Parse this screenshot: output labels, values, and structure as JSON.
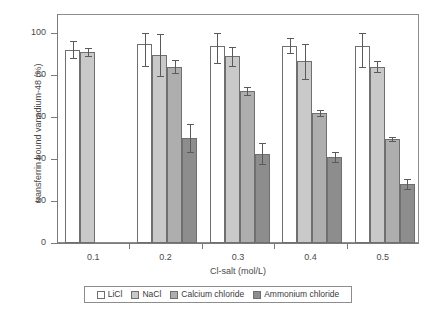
{
  "chart_data": {
    "type": "bar",
    "title": "",
    "subtitle": "",
    "xlabel": "Cl-salt (mol/L)",
    "ylabel": "transferrin bound vanadium-48 (%)",
    "categories": [
      "0.1",
      "0.2",
      "0.3",
      "0.4",
      "0.5"
    ],
    "ylim": [
      0,
      100
    ],
    "yticks": [
      0,
      20,
      40,
      60,
      80,
      100
    ],
    "ytick_labels": [
      "0",
      "20",
      "40",
      "60",
      "80",
      "100"
    ],
    "grid": false,
    "legend_position": "bottom",
    "series": [
      {
        "name": "LiCl",
        "color": "#ffffff",
        "values": [
          92,
          95,
          94,
          94,
          94
        ],
        "errors": [
          4,
          10.5,
          8.5,
          3.5,
          10
        ]
      },
      {
        "name": "NaCl",
        "color": "#c9c9c9",
        "values": [
          91,
          89.5,
          89,
          86.5,
          84
        ],
        "errors": [
          2,
          10,
          4.5,
          8.5,
          2.5
        ]
      },
      {
        "name": "Calcium chloride",
        "color": "#aeaeae",
        "values": [
          null,
          84,
          72.5,
          62,
          49.5
        ],
        "errors": [
          null,
          3,
          2,
          1.5,
          1
        ]
      },
      {
        "name": "Ammonium chloride",
        "color": "#8d8d8d",
        "values": [
          null,
          50,
          42.5,
          41,
          28
        ],
        "errors": [
          null,
          6.5,
          5,
          2.5,
          2.5
        ]
      }
    ]
  },
  "legend": {
    "entries": [
      {
        "label": "LiCl"
      },
      {
        "label": "NaCl"
      },
      {
        "label": "Calcium chloride"
      },
      {
        "label": "Ammonium chloride"
      }
    ]
  },
  "colors": {
    "axis": "#7a7a7a",
    "frame": "#8d8d8d",
    "bar_outline": "#6f6f6f",
    "error_bar": "#5a5a5a",
    "text": "#3a3a3a",
    "background": "#ffffff"
  }
}
